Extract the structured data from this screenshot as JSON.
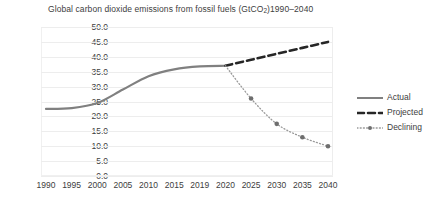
{
  "chart_data": {
    "type": "line",
    "title": "Global carbon dioxide emissions from fossil fuels (GtCO2)1990–2040",
    "title_prefix": "Global carbon dioxide emissions from fossil fuels (GtCO",
    "title_sub": "2",
    "title_suffix": ")1990–2040",
    "xlabel": "",
    "ylabel": "",
    "x": [
      1990,
      1995,
      2000,
      2005,
      2010,
      2015,
      2019,
      2020,
      2025,
      2030,
      2035,
      2040
    ],
    "categories": [
      "1990",
      "1995",
      "2000",
      "2005",
      "2010",
      "2015",
      "2019",
      "2020",
      "2025",
      "2030",
      "2035",
      "2040"
    ],
    "xlim": [
      1990,
      2040
    ],
    "ylim": [
      0,
      50
    ],
    "ytick_values": [
      0,
      5,
      10,
      15,
      20,
      25,
      30,
      35,
      40,
      45,
      50
    ],
    "ytick_labels": [
      "0.0",
      "5.0",
      "10.0",
      "15.0",
      "20.0",
      "25.0",
      "30.0",
      "35.0",
      "40.0",
      "45.0",
      "50.0"
    ],
    "grid": true,
    "legend_position": "right",
    "series": [
      {
        "name": "Actual",
        "style": "solid",
        "color": "#808080",
        "markers": false,
        "x": [
          1990,
          1995,
          2000,
          2005,
          2010,
          2015,
          2019,
          2020
        ],
        "values": [
          22.5,
          22.8,
          24.5,
          29.0,
          33.5,
          35.8,
          36.8,
          37.0
        ]
      },
      {
        "name": "Projected",
        "style": "dashed",
        "color": "#262626",
        "markers": false,
        "x": [
          2020,
          2025,
          2030,
          2035,
          2040
        ],
        "values": [
          37.0,
          39.0,
          41.0,
          43.0,
          45.0
        ]
      },
      {
        "name": "Declining",
        "style": "dotted",
        "color": "#9a9a9a",
        "markers": true,
        "x": [
          2020,
          2025,
          2030,
          2035,
          2040
        ],
        "values": [
          37.0,
          26.0,
          17.5,
          13.0,
          10.0
        ]
      }
    ]
  },
  "legend": {
    "items": [
      {
        "label": "Actual",
        "style": "solid",
        "color": "#808080"
      },
      {
        "label": "Projected",
        "style": "dashed",
        "color": "#262626"
      },
      {
        "label": "Declining",
        "style": "dotted",
        "color": "#9a9a9a"
      }
    ]
  },
  "colors": {
    "actual": "#808080",
    "projected": "#262626",
    "declining": "#9a9a9a",
    "grid": "#ededed",
    "text": "#404040",
    "background": "#ffffff"
  }
}
